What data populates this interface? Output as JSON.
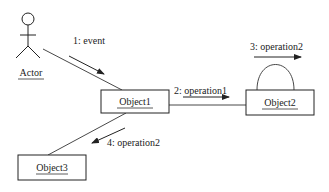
{
  "diagram": {
    "type": "UML collaboration diagram",
    "actor": {
      "label": "Actor"
    },
    "objects": [
      {
        "id": "object1",
        "label": "Object1"
      },
      {
        "id": "object2",
        "label": "Object2"
      },
      {
        "id": "object3",
        "label": "Object3"
      }
    ],
    "messages": [
      {
        "label": "1:  event",
        "from": "Actor",
        "to": "Object1"
      },
      {
        "label": "2:  operation1",
        "from": "Object1",
        "to": "Object2"
      },
      {
        "label": "3:  operation2",
        "from": "Object2",
        "to": "Object2"
      },
      {
        "label": "4:  operation2",
        "from": "Object1",
        "to": "Object3"
      }
    ],
    "colors": {
      "stroke": "#222222",
      "background": "#ffffff"
    }
  }
}
